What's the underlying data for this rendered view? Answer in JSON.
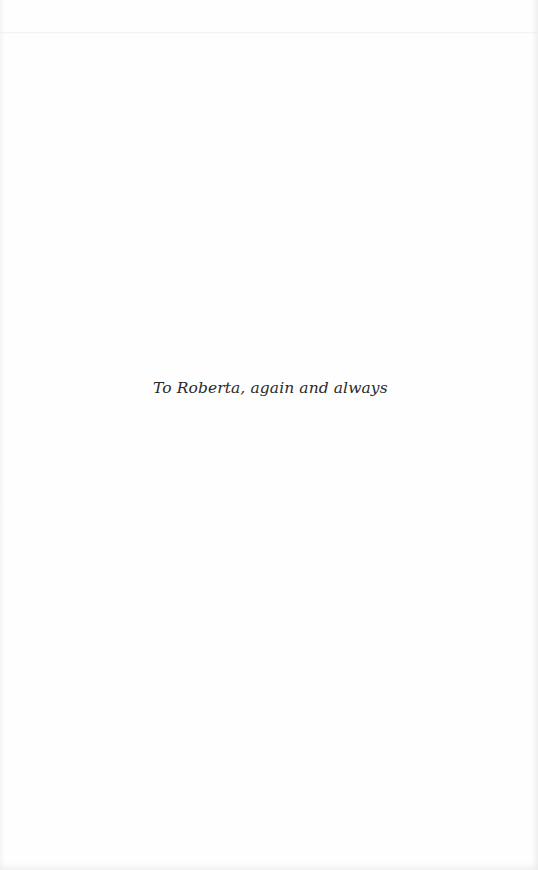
{
  "page": {
    "type": "dedication",
    "dedication_text": "To Roberta, again and always"
  },
  "colors": {
    "background": "#fefefe",
    "text": "#2a2a2a"
  }
}
